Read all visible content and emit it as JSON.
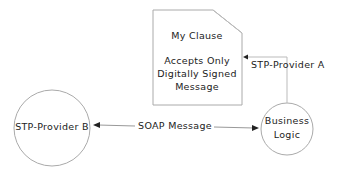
{
  "document": {
    "title": "My Clause",
    "lines": [
      "Accepts  Only",
      "Digitally  Signed",
      "Message"
    ]
  },
  "nodes": {
    "provider_b": "STP-Provider  B",
    "business_logic": [
      "Business",
      "Logic"
    ]
  },
  "edges": {
    "soap_message": "SOAP  Message",
    "provider_a": "STP-Provider  A"
  },
  "colors": {
    "stroke": "#999999",
    "text": "#222222",
    "arrow": "#222222"
  }
}
